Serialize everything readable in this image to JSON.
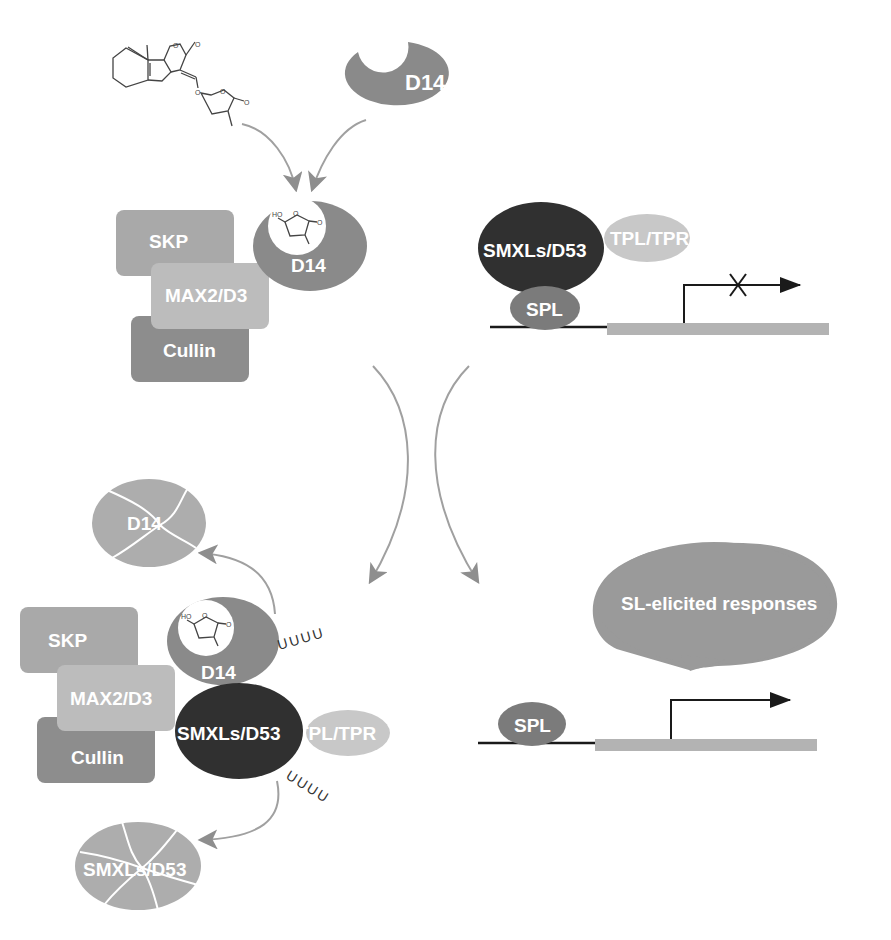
{
  "colors": {
    "skp": "#a9a9a9",
    "max2": "#bcbcbc",
    "cullin": "#8d8d8d",
    "d14": "#8a8a8a",
    "smxl": "#303030",
    "tpl": "#c8c8c8",
    "spl": "#7b7b7b",
    "gene_bar": "#b3b3b3",
    "degraded": "#adadad",
    "response": "#9a9a9a",
    "arrow": "#9b9b9b",
    "dna": "#222222"
  },
  "top_left": {
    "ligand": "strigolactone molecule (GR24)",
    "free_receptor": "D14",
    "complex": {
      "skp": "SKP",
      "max2": "MAX2/D3",
      "cullin": "Cullin",
      "d14": "D14",
      "bound_ligand": {
        "ho": "HO",
        "o_ring": "O",
        "o_carbonyl": "O"
      }
    }
  },
  "top_right": {
    "repressor": "SMXLs/D53",
    "corepressor": "TPL/TPR",
    "tf": "SPL",
    "transcription": "blocked"
  },
  "bottom_left": {
    "degraded_d14": "D14",
    "skp": "SKP",
    "max2": "MAX2/D3",
    "cullin": "Cullin",
    "d14": "D14",
    "repressor": "SMXLs/D53",
    "corepressor": "TPL/TPR",
    "ubiquitin_d14": "UUUU",
    "ubiquitin_smxl": "UUUU",
    "degraded_smxl": "SMXLs/D53",
    "bound_ligand": {
      "ho": "HO",
      "o_ring": "O",
      "o_carbonyl": "O"
    }
  },
  "bottom_right": {
    "response": "SL-elicited responses",
    "tf": "SPL",
    "transcription": "active"
  },
  "chemistry": {
    "o1": "O",
    "o2": "O",
    "o3": "O",
    "o4": "O",
    "o5": "O"
  }
}
